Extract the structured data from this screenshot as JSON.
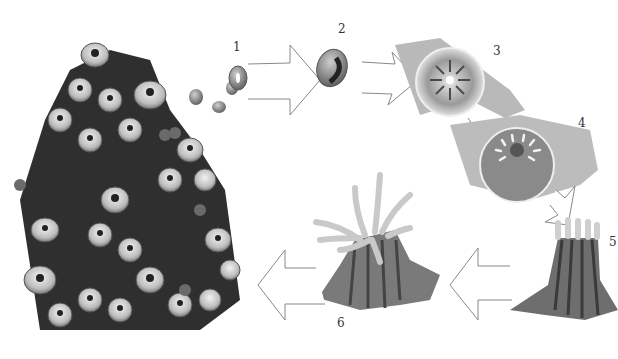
{
  "diagram": {
    "palette": {
      "background": "#ffffff",
      "ink": "#333333",
      "arrow_stroke": "#888888",
      "shade_dark": "#3a3a3a",
      "shade_mid": "#8a8a8a",
      "shade_light": "#d6d6d6"
    },
    "stages": [
      {
        "number": "1",
        "name": "egg / gametes released"
      },
      {
        "number": "2",
        "name": "larva (planula)"
      },
      {
        "number": "3",
        "name": "settled polyp (top view)"
      },
      {
        "number": "4",
        "name": "developing polyp with tentacles"
      },
      {
        "number": "5",
        "name": "young polyp"
      },
      {
        "number": "6",
        "name": "mature polyp"
      }
    ],
    "arrows": [
      "1 to 2",
      "2 to 3",
      "3 to 4",
      "4 to 5",
      "5 to 6",
      "6 to colony"
    ]
  }
}
